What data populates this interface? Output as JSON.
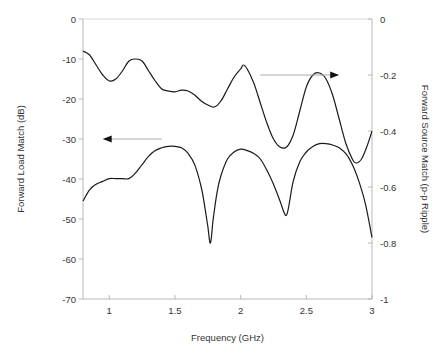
{
  "chart_data": {
    "type": "line",
    "title": "",
    "xlabel": "Frequency (GHz)",
    "ylabel": "Forward Load Match (dB)",
    "y2label": "Forward Source Match (p-p Ripple)",
    "xlim": [
      0.8,
      3.0
    ],
    "ylim": [
      -70,
      0
    ],
    "y2lim": [
      -1,
      0
    ],
    "x_ticks": [
      "1",
      "1.5",
      "2",
      "2.5",
      "3"
    ],
    "x_tick_values": [
      1,
      1.5,
      2,
      2.5,
      3
    ],
    "y_ticks": [
      "0",
      "-10",
      "-20",
      "-30",
      "-40",
      "-50",
      "-60",
      "-70"
    ],
    "y_tick_values": [
      0,
      -10,
      -20,
      -30,
      -40,
      -50,
      -60,
      -70
    ],
    "y2_ticks": [
      "0",
      "-0.2",
      "-0.4",
      "-0.6",
      "-0.8",
      "-1"
    ],
    "y2_tick_values": [
      0,
      -0.2,
      -0.4,
      -0.6,
      -0.8,
      -1
    ],
    "grid": false,
    "legend": "none (arrows indicate axis association)",
    "annotations": [
      {
        "type": "arrow",
        "direction": "left",
        "points_to": "left axis",
        "near_series": "Forward Load Match",
        "from": [
          1.4,
          -30
        ],
        "to": [
          0.95,
          -30
        ]
      },
      {
        "type": "arrow",
        "direction": "right",
        "points_to": "right axis",
        "near_series": "Forward Source Match",
        "from": [
          2.15,
          -0.2
        ],
        "to": [
          2.75,
          -0.2
        ]
      }
    ],
    "series": [
      {
        "name": "Forward Load Match",
        "axis": "left",
        "unit": "dB",
        "x": [
          0.8,
          0.85,
          0.9,
          0.95,
          1.0,
          1.05,
          1.1,
          1.15,
          1.2,
          1.25,
          1.3,
          1.35,
          1.4,
          1.45,
          1.5,
          1.55,
          1.6,
          1.65,
          1.7,
          1.75,
          1.8,
          1.85,
          1.9,
          1.95,
          2.0,
          2.02,
          2.05,
          2.1,
          2.15,
          2.2,
          2.25,
          2.3,
          2.35,
          2.4,
          2.45,
          2.5,
          2.55,
          2.6,
          2.65,
          2.7,
          2.75,
          2.8,
          2.85,
          2.88,
          2.92,
          2.96,
          3.0
        ],
        "values": [
          -8,
          -9,
          -11.5,
          -14,
          -15.5,
          -15,
          -13,
          -10.5,
          -10,
          -10.5,
          -13,
          -15.5,
          -17.5,
          -18,
          -18.2,
          -17.8,
          -18,
          -19,
          -20.5,
          -21.5,
          -22,
          -20.5,
          -17.5,
          -14.5,
          -12.5,
          -11.5,
          -12.5,
          -16,
          -21,
          -26,
          -30,
          -32,
          -32,
          -29,
          -23,
          -17,
          -14,
          -13.5,
          -15,
          -19,
          -25,
          -31,
          -35,
          -36,
          -35,
          -32,
          -28
        ]
      },
      {
        "name": "Forward Source Match",
        "axis": "right",
        "unit": "p-p ripple",
        "x": [
          0.8,
          0.85,
          0.9,
          0.95,
          1.0,
          1.05,
          1.1,
          1.15,
          1.2,
          1.25,
          1.3,
          1.35,
          1.4,
          1.45,
          1.5,
          1.55,
          1.6,
          1.65,
          1.7,
          1.73,
          1.75,
          1.77,
          1.79,
          1.82,
          1.85,
          1.9,
          1.95,
          2.0,
          2.05,
          2.1,
          2.15,
          2.2,
          2.25,
          2.3,
          2.33,
          2.35,
          2.37,
          2.4,
          2.45,
          2.5,
          2.55,
          2.6,
          2.65,
          2.7,
          2.75,
          2.8,
          2.85,
          2.9,
          2.95,
          3.0
        ],
        "values": [
          -0.65,
          -0.61,
          -0.59,
          -0.58,
          -0.57,
          -0.57,
          -0.57,
          -0.57,
          -0.55,
          -0.52,
          -0.49,
          -0.47,
          -0.46,
          -0.455,
          -0.455,
          -0.46,
          -0.48,
          -0.52,
          -0.6,
          -0.68,
          -0.74,
          -0.8,
          -0.72,
          -0.62,
          -0.56,
          -0.5,
          -0.475,
          -0.465,
          -0.47,
          -0.48,
          -0.5,
          -0.54,
          -0.59,
          -0.65,
          -0.69,
          -0.7,
          -0.66,
          -0.58,
          -0.51,
          -0.475,
          -0.455,
          -0.445,
          -0.445,
          -0.45,
          -0.46,
          -0.48,
          -0.52,
          -0.58,
          -0.66,
          -0.78
        ]
      }
    ]
  }
}
